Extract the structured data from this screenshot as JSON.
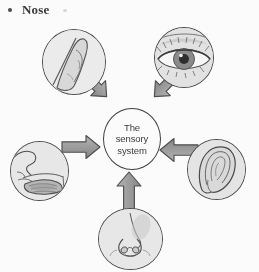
{
  "heading": {
    "bullet_glyph": "bullet-dot",
    "label": "Nose"
  },
  "diagram": {
    "center": {
      "label": "The\nsensory\nsystem",
      "shape": "circle",
      "fill": "#ffffff",
      "stroke": "#3d3d3d"
    },
    "arrow_style": {
      "fill": "#9a9a98",
      "stroke": "#4c4c4c",
      "direction": "inward-to-center"
    },
    "nodes": [
      {
        "id": "touch",
        "icon": "fingertip-skin-icon",
        "organ": "Finger / skin",
        "sense": "Touch",
        "position": "top-left"
      },
      {
        "id": "sight",
        "icon": "eye-icon",
        "organ": "Eye",
        "sense": "Sight",
        "position": "top-right"
      },
      {
        "id": "taste",
        "icon": "mouth-tongue-cross-section-icon",
        "organ": "Mouth / tongue",
        "sense": "Taste",
        "position": "left"
      },
      {
        "id": "hearing",
        "icon": "ear-icon",
        "organ": "Ear",
        "sense": "Hearing",
        "position": "right"
      },
      {
        "id": "smell",
        "icon": "nose-icon",
        "organ": "Nose",
        "sense": "Smell",
        "position": "bottom"
      }
    ]
  }
}
